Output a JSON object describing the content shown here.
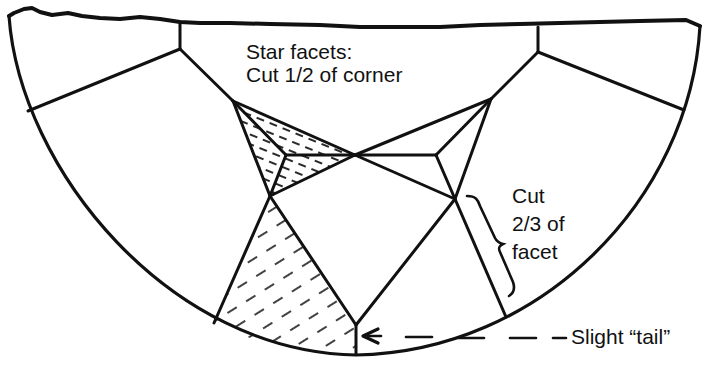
{
  "diagram": {
    "colors": {
      "ink": "#111111",
      "background": "#ffffff"
    },
    "labels": {
      "star_facets": {
        "line1": "Star facets:",
        "line2": "Cut 1/2 of corner"
      },
      "cut_two_thirds": {
        "line1": "Cut",
        "line2": "2/3 of",
        "line3": "facet"
      },
      "tail": {
        "text": "Slight “tail”"
      }
    },
    "hatched_regions": [
      "star-facet-hatched",
      "lower-facet-hatched"
    ]
  }
}
